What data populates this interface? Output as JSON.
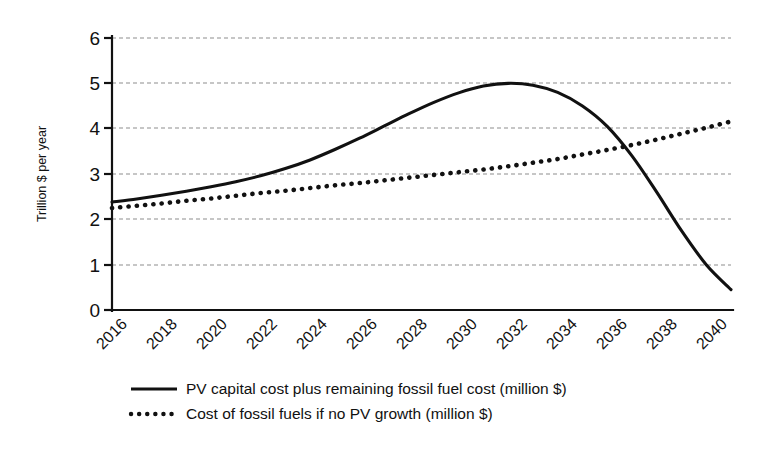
{
  "chart_data": {
    "type": "line",
    "title": "",
    "subtitle": "",
    "xlabel": "",
    "ylabel": "Trillion $ per year",
    "xlim": [
      2016,
      2041
    ],
    "ylim": [
      0,
      6
    ],
    "yticks": [
      "0",
      "1",
      "2",
      "3",
      "4",
      "5",
      "6"
    ],
    "ytick_values": [
      0,
      1,
      2,
      3,
      4,
      5,
      6
    ],
    "xticks": [
      "2016",
      "2018",
      "2020",
      "2022",
      "2024",
      "2026",
      "2028",
      "2030",
      "2032",
      "2034",
      "2036",
      "2038",
      "2040"
    ],
    "xtick_values": [
      2016,
      2018,
      2020,
      2022,
      2024,
      2026,
      2028,
      2030,
      2032,
      2034,
      2036,
      2038,
      2040
    ],
    "grid": "horizontal",
    "legend_position": "bottom",
    "x": [
      2016,
      2017,
      2018,
      2019,
      2020,
      2021,
      2022,
      2023,
      2024,
      2025,
      2026,
      2027,
      2028,
      2029,
      2030,
      2031,
      2032,
      2033,
      2034,
      2035,
      2036,
      2037,
      2038,
      2039,
      2040,
      2041
    ],
    "series": [
      {
        "name": "PV capital cost plus remaining fossil fuel cost (million $)",
        "style": "solid",
        "color": "#111111",
        "values": [
          2.38,
          2.45,
          2.53,
          2.62,
          2.72,
          2.83,
          2.96,
          3.12,
          3.31,
          3.54,
          3.79,
          4.06,
          4.33,
          4.58,
          4.79,
          4.94,
          5.0,
          4.96,
          4.8,
          4.5,
          4.05,
          3.4,
          2.6,
          1.75,
          1.0,
          0.45
        ]
      },
      {
        "name": "Cost of fossil fuels if no PV growth (million $)",
        "style": "dotted",
        "color": "#111111",
        "values": [
          2.25,
          2.3,
          2.35,
          2.41,
          2.46,
          2.52,
          2.58,
          2.63,
          2.69,
          2.75,
          2.8,
          2.86,
          2.92,
          2.98,
          3.04,
          3.1,
          3.17,
          3.25,
          3.33,
          3.43,
          3.53,
          3.64,
          3.76,
          3.89,
          4.02,
          4.16
        ]
      }
    ],
    "annotations": []
  },
  "legend": {
    "items": [
      {
        "label": "PV capital cost plus remaining fossil fuel cost (million $)",
        "style": "solid"
      },
      {
        "label": "Cost of fossil fuels if no PV growth (million $)",
        "style": "dotted"
      }
    ]
  }
}
